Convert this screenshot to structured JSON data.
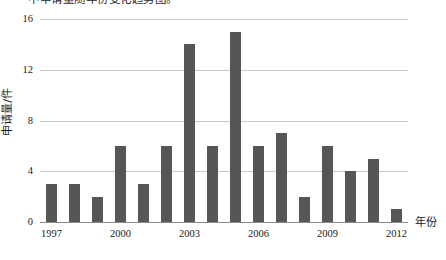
{
  "caption": {
    "partial_text_top": "中申请量随年份变化趋势图。"
  },
  "chart_data": {
    "type": "bar",
    "title": "",
    "xlabel": "年份",
    "ylabel": "申请量/件",
    "categories": [
      "1997",
      "1998",
      "1999",
      "2000",
      "2001",
      "2002",
      "2003",
      "2004",
      "2005",
      "2006",
      "2007",
      "2008",
      "2009",
      "2010",
      "2011",
      "2012"
    ],
    "values": [
      3,
      3,
      2,
      6,
      3,
      6,
      14,
      6,
      15,
      6,
      7,
      2,
      6,
      4,
      5,
      1
    ],
    "ylim": [
      0,
      16
    ],
    "yticks": [
      0,
      4,
      8,
      12,
      16
    ],
    "ytick_labels": [
      "0",
      "4",
      "8",
      "12",
      "16"
    ],
    "xtick_labels": [
      "1997",
      "2000",
      "2003",
      "2006",
      "2009",
      "2012"
    ],
    "xtick_categories": [
      "1997",
      "2000",
      "2003",
      "2006",
      "2009",
      "2012"
    ],
    "grid": true,
    "legend": "none",
    "bar_color": "#565656",
    "grid_color": "#c9c9c9",
    "axis_color": "#8a8a8a",
    "background": "#ffffff"
  }
}
